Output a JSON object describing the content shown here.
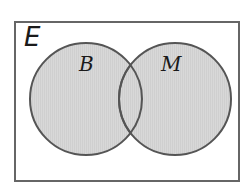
{
  "diagram": {
    "type": "venn",
    "universe": {
      "label": "E"
    },
    "sets": [
      {
        "label": "B",
        "shaded": true
      },
      {
        "label": "M",
        "shaded": true
      }
    ],
    "intersection_shaded": true,
    "colors": {
      "fill": "#d3d3d3",
      "stroke": "#555555",
      "frame": "#666666"
    }
  }
}
